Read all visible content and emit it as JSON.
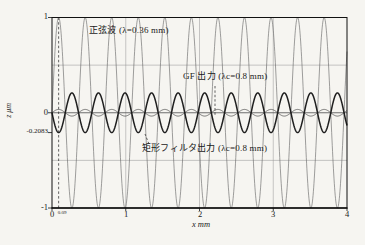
{
  "chart_data": {
    "type": "line",
    "title": "",
    "xlabel": "x mm",
    "ylabel": "z μm",
    "xlim": [
      0,
      4
    ],
    "ylim": [
      -1,
      1
    ],
    "grid": {
      "vertical_x_mm": [
        1,
        2,
        3
      ],
      "horizontal_z": [
        0.5,
        -0.5
      ]
    },
    "marker_line_x_mm": 0.09,
    "x_ticks": [
      {
        "v": 0,
        "label": "0"
      },
      {
        "v": 1,
        "label": "1"
      },
      {
        "v": 2,
        "label": "2"
      },
      {
        "v": 3,
        "label": "3"
      },
      {
        "v": 4,
        "label": "4"
      }
    ],
    "x_minor_tick": {
      "v": 0.09,
      "label": "0.09"
    },
    "y_ticks": [
      {
        "v": 1,
        "label": "1"
      },
      {
        "v": 0,
        "label": "0"
      },
      {
        "v": -0.2083,
        "label": "-0.2083"
      },
      {
        "v": -1,
        "label": "-1"
      }
    ],
    "series": [
      {
        "key": "sine",
        "name": "正弦波 (λ=0.36 mm)",
        "wavelength_mm": 0.36,
        "amplitude": 1.0,
        "color": "#6b6b6b",
        "width": 0.65
      },
      {
        "key": "gf",
        "name": "GF 出力 (λc=0.8 mm)",
        "wavelength_mm": 0.36,
        "amplitude": 0.035,
        "color": "#3c3c3c",
        "width": 0.7
      },
      {
        "key": "rect",
        "name": "矩形フィルタ出力 (λc=0.8 mm)",
        "wavelength_mm": 0.36,
        "amplitude": -0.2083,
        "color": "#1f1f1f",
        "width": 1.5
      }
    ],
    "annotations": [
      {
        "key": "sine-label",
        "text": "正弦波 (λ=0.36 mm)"
      },
      {
        "key": "gf-label",
        "text": "GF 出力 (λc=0.8 mm)"
      },
      {
        "key": "rect-label",
        "text": "矩形フィルタ出力 (λc=0.8 mm)"
      }
    ]
  },
  "colors": {
    "background": "#f6f5f1",
    "frame": "#111111",
    "grid": "#9a9a9a",
    "zero_line": "#5e5e5e",
    "marker": "#222222",
    "text": "#1a1a1a"
  }
}
